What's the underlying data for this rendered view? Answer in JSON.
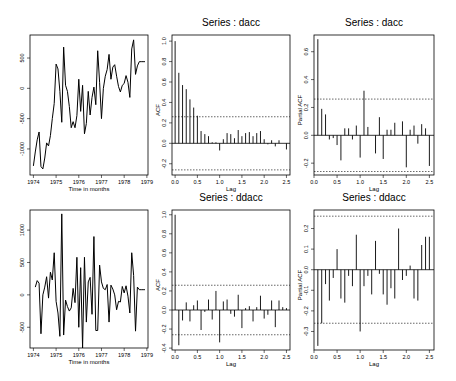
{
  "chart_data": [
    {
      "id": "ts-dacc",
      "type": "line",
      "title": "",
      "xlabel": "Time in months",
      "ylabel": "",
      "box": {
        "x": 30,
        "y": 35,
        "w": 118,
        "h": 140
      },
      "xlim": [
        1973.85,
        1979.05
      ],
      "ylim": [
        -1430,
        880
      ],
      "xticks": [
        1974,
        1975,
        1976,
        1977,
        1978,
        1979
      ],
      "xtick_labels": [
        "1974",
        "1975",
        "1976",
        "1977",
        "1978",
        "1979"
      ],
      "yticks": [
        -1000,
        -500,
        0,
        500
      ],
      "ytick_labels": [
        "-1000",
        "-500",
        "0",
        "500"
      ],
      "grid": false,
      "x": [
        1974.0,
        1974.083,
        1974.167,
        1974.25,
        1974.333,
        1974.417,
        1974.5,
        1974.583,
        1974.667,
        1974.75,
        1974.833,
        1974.917,
        1975.0,
        1975.083,
        1975.167,
        1975.25,
        1975.333,
        1975.417,
        1975.5,
        1975.583,
        1975.667,
        1975.75,
        1975.833,
        1975.917,
        1976.0,
        1976.083,
        1976.167,
        1976.25,
        1976.333,
        1976.417,
        1976.5,
        1976.583,
        1976.667,
        1976.75,
        1976.833,
        1976.917,
        1977.0,
        1977.083,
        1977.167,
        1977.25,
        1977.333,
        1977.417,
        1977.5,
        1977.583,
        1977.667,
        1977.75,
        1977.833,
        1977.917,
        1978.0,
        1978.083,
        1978.167,
        1978.25,
        1978.333,
        1978.417,
        1978.5,
        1978.583,
        1978.667,
        1978.75,
        1978.833,
        1978.917
      ],
      "values": [
        -1280,
        -1050,
        -850,
        -720,
        -1290,
        -1330,
        -1150,
        -900,
        -950,
        -780,
        -500,
        -250,
        400,
        320,
        -50,
        -560,
        680,
        50,
        -50,
        -300,
        -650,
        -550,
        -650,
        -450,
        150,
        -380,
        50,
        -750,
        -580,
        -50,
        -440,
        -150,
        20,
        -270,
        620,
        100,
        -500,
        0,
        200,
        310,
        560,
        150,
        350,
        390,
        200,
        30,
        -60,
        50,
        80,
        210,
        100,
        -150,
        650,
        800,
        230,
        370,
        440,
        440,
        440,
        440
      ]
    },
    {
      "id": "acf-dacc",
      "type": "bar",
      "title": "Series : dacc",
      "xlabel": "Lag",
      "ylabel": "ACF",
      "box": {
        "x": 172,
        "y": 35,
        "w": 118,
        "h": 140
      },
      "xlim": [
        -0.07,
        2.58
      ],
      "ylim": [
        -0.31,
        1.06
      ],
      "xticks": [
        0.0,
        0.5,
        1.0,
        1.5,
        2.0,
        2.5
      ],
      "xtick_labels": [
        "0.0",
        "0.5",
        "1.0",
        "1.5",
        "2.0",
        "2.5"
      ],
      "yticks": [
        -0.2,
        0.0,
        0.2,
        0.4,
        0.6,
        0.8,
        1.0
      ],
      "ytick_labels": [
        "-0.2",
        "0.0",
        "0.2",
        "0.4",
        "0.6",
        "0.8",
        "1.0"
      ],
      "conf_band": 0.26,
      "grid": false,
      "lags": [
        0.0,
        0.083,
        0.167,
        0.25,
        0.333,
        0.417,
        0.5,
        0.583,
        0.667,
        0.75,
        0.833,
        0.917,
        1.0,
        1.083,
        1.167,
        1.25,
        1.333,
        1.417,
        1.5,
        1.583,
        1.667,
        1.75,
        1.833,
        1.917,
        2.0,
        2.083,
        2.167,
        2.25,
        2.333,
        2.417,
        2.5
      ],
      "values": [
        1.0,
        0.69,
        0.57,
        0.53,
        0.43,
        0.35,
        0.27,
        0.12,
        0.09,
        0.07,
        0.01,
        0.01,
        -0.07,
        0.04,
        0.1,
        0.09,
        0.05,
        0.13,
        0.07,
        0.1,
        0.11,
        0.07,
        0.1,
        0.12,
        0.04,
        -0.01,
        0.03,
        -0.03,
        0.03,
        0.0,
        -0.06
      ]
    },
    {
      "id": "pacf-dacc",
      "type": "bar",
      "title": "Series : dacc",
      "xlabel": "Lag",
      "ylabel": "Partial ACF",
      "box": {
        "x": 314,
        "y": 35,
        "w": 120,
        "h": 140
      },
      "xlim": [
        0.0,
        2.6
      ],
      "ylim": [
        -0.285,
        0.72
      ],
      "xticks": [
        0.0,
        0.5,
        1.0,
        1.5,
        2.0,
        2.5
      ],
      "xtick_labels": [
        "0.0",
        "0.5",
        "1.0",
        "1.5",
        "2.0",
        "2.5"
      ],
      "yticks": [
        -0.2,
        0.0,
        0.2,
        0.4,
        0.6
      ],
      "ytick_labels": [
        "-0.2",
        "0.0",
        "0.2",
        "0.4",
        "0.6"
      ],
      "conf_band": 0.26,
      "grid": false,
      "lags": [
        0.083,
        0.167,
        0.25,
        0.333,
        0.417,
        0.5,
        0.583,
        0.667,
        0.75,
        0.833,
        0.917,
        1.0,
        1.083,
        1.167,
        1.25,
        1.333,
        1.417,
        1.5,
        1.583,
        1.667,
        1.75,
        1.833,
        1.917,
        2.0,
        2.083,
        2.167,
        2.25,
        2.333,
        2.417,
        2.5
      ],
      "values": [
        0.69,
        0.19,
        0.15,
        -0.03,
        -0.02,
        -0.07,
        -0.18,
        0.05,
        0.05,
        -0.03,
        0.07,
        -0.16,
        0.32,
        0.06,
        0.0,
        -0.13,
        0.13,
        -0.17,
        0.04,
        0.04,
        0.09,
        0.0,
        0.1,
        -0.23,
        0.04,
        0.07,
        -0.06,
        0.08,
        0.05,
        -0.22
      ]
    },
    {
      "id": "ts-ddacc",
      "type": "line",
      "title": "",
      "xlabel": "Time in months",
      "ylabel": "",
      "box": {
        "x": 30,
        "y": 210,
        "w": 118,
        "h": 138
      },
      "xlim": [
        1973.85,
        1979.05
      ],
      "ylim": [
        -820,
        1310
      ],
      "xticks": [
        1974,
        1975,
        1976,
        1977,
        1978,
        1979
      ],
      "xtick_labels": [
        "1974",
        "1975",
        "1976",
        "1977",
        "1978",
        "1979"
      ],
      "yticks": [
        -500,
        0,
        500,
        1000
      ],
      "ytick_labels": [
        "-500",
        "0",
        "500",
        "1000"
      ],
      "grid": false,
      "x": [
        1974.083,
        1974.167,
        1974.25,
        1974.333,
        1974.417,
        1974.5,
        1974.583,
        1974.667,
        1974.75,
        1974.833,
        1974.917,
        1975.0,
        1975.083,
        1975.167,
        1975.25,
        1975.333,
        1975.417,
        1975.5,
        1975.583,
        1975.667,
        1975.75,
        1975.833,
        1975.917,
        1976.0,
        1976.083,
        1976.167,
        1976.25,
        1976.333,
        1976.417,
        1976.5,
        1976.583,
        1976.667,
        1976.75,
        1976.833,
        1976.917,
        1977.0,
        1977.083,
        1977.167,
        1977.25,
        1977.333,
        1977.417,
        1977.5,
        1977.583,
        1977.667,
        1977.75,
        1977.833,
        1977.917,
        1978.0,
        1978.083,
        1978.167,
        1978.25,
        1978.333,
        1978.417,
        1978.5,
        1978.583,
        1978.667,
        1978.75,
        1978.833,
        1978.917
      ],
      "values": [
        120,
        220,
        180,
        -600,
        0,
        120,
        280,
        -50,
        350,
        230,
        650,
        -100,
        -280,
        -640,
        1250,
        -620,
        -80,
        -180,
        -250,
        -200,
        100,
        -120,
        580,
        -500,
        420,
        -820,
        580,
        -420,
        200,
        270,
        -300,
        900,
        -550,
        -550,
        460,
        200,
        100,
        80,
        160,
        -420,
        150,
        90,
        0,
        -230,
        -100,
        -110,
        130,
        30,
        140,
        -20,
        -280,
        650,
        300,
        -560,
        120,
        80,
        80,
        80,
        80
      ]
    },
    {
      "id": "acf-ddacc",
      "type": "bar",
      "title": "Series : ddacc",
      "xlabel": "Lag",
      "ylabel": "ACF",
      "box": {
        "x": 172,
        "y": 210,
        "w": 118,
        "h": 140
      },
      "xlim": [
        -0.07,
        2.58
      ],
      "ylim": [
        -0.42,
        1.05
      ],
      "xticks": [
        0.0,
        0.5,
        1.0,
        1.5,
        2.0,
        2.5
      ],
      "xtick_labels": [
        "0.0",
        "0.5",
        "1.0",
        "1.5",
        "2.0",
        "2.5"
      ],
      "yticks": [
        -0.4,
        -0.2,
        0.0,
        0.2,
        0.4,
        0.6,
        0.8,
        1.0
      ],
      "ytick_labels": [
        "-0.4",
        "-0.2",
        "0.0",
        "0.2",
        "0.4",
        "0.6",
        "0.8",
        "1.0"
      ],
      "conf_band": 0.26,
      "grid": false,
      "lags": [
        0.0,
        0.083,
        0.167,
        0.25,
        0.333,
        0.417,
        0.5,
        0.583,
        0.667,
        0.75,
        0.833,
        0.917,
        1.0,
        1.083,
        1.167,
        1.25,
        1.333,
        1.417,
        1.5,
        1.583,
        1.667,
        1.75,
        1.833,
        1.917,
        2.0,
        2.083,
        2.167,
        2.25,
        2.333,
        2.417,
        2.5
      ],
      "values": [
        1.0,
        -0.37,
        -0.11,
        0.08,
        -0.12,
        0.05,
        0.1,
        -0.21,
        -0.02,
        0.11,
        -0.1,
        0.2,
        -0.34,
        0.09,
        0.11,
        -0.04,
        -0.07,
        0.16,
        -0.19,
        0.02,
        0.04,
        -0.12,
        0.03,
        0.15,
        -0.09,
        -0.05,
        0.1,
        -0.18,
        0.1,
        0.03,
        0.02
      ]
    },
    {
      "id": "pacf-ddacc",
      "type": "bar",
      "title": "Series : ddacc",
      "xlabel": "Lag",
      "ylabel": "Partial ACF",
      "box": {
        "x": 314,
        "y": 210,
        "w": 120,
        "h": 140
      },
      "xlim": [
        0.0,
        2.6
      ],
      "ylim": [
        -0.39,
        0.29
      ],
      "xticks": [
        0.0,
        0.5,
        1.0,
        1.5,
        2.0,
        2.5
      ],
      "xtick_labels": [
        "0.0",
        "0.5",
        "1.0",
        "1.5",
        "2.0",
        "2.5"
      ],
      "yticks": [
        -0.3,
        -0.2,
        -0.1,
        0.0,
        0.1,
        0.2
      ],
      "ytick_labels": [
        "-0.3",
        "-0.2",
        "-0.1",
        "0.0",
        "0.1",
        "0.2"
      ],
      "conf_band": 0.26,
      "grid": false,
      "lags": [
        0.083,
        0.167,
        0.25,
        0.333,
        0.417,
        0.5,
        0.583,
        0.667,
        0.75,
        0.833,
        0.917,
        1.0,
        1.083,
        1.167,
        1.25,
        1.333,
        1.417,
        1.5,
        1.583,
        1.667,
        1.75,
        1.833,
        1.917,
        2.0,
        2.083,
        2.167,
        2.25,
        2.333,
        2.417,
        2.5
      ],
      "values": [
        -0.37,
        -0.26,
        -0.07,
        -0.15,
        -0.04,
        0.1,
        -0.14,
        -0.16,
        -0.03,
        -0.08,
        0.17,
        -0.3,
        -0.08,
        -0.03,
        -0.12,
        0.14,
        -0.02,
        -0.12,
        -0.17,
        -0.09,
        -0.14,
        0.2,
        -0.05,
        -0.03,
        0.02,
        -0.14,
        -0.15,
        0.12,
        0.16,
        0.16
      ]
    }
  ]
}
